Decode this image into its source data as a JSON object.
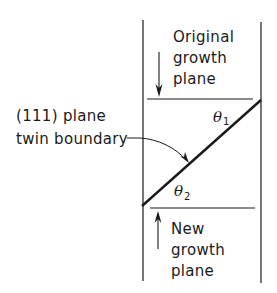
{
  "figure": {
    "type": "schematic",
    "colors": {
      "stroke": "#1a1a1a",
      "background": "#ffffff"
    }
  },
  "labels": {
    "original_growth": [
      "Original",
      "growth",
      "plane"
    ],
    "new_growth": [
      "New",
      "growth",
      "plane"
    ],
    "twin_boundary": [
      "(111) plane",
      "twin boundary"
    ],
    "theta1": {
      "symbol": "θ",
      "subscript": "1"
    },
    "theta2": {
      "symbol": "θ",
      "subscript": "2"
    }
  }
}
